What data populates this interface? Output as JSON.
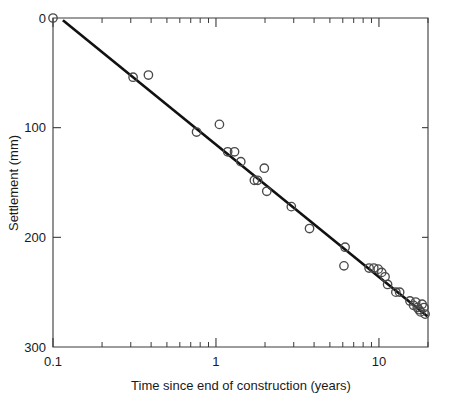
{
  "chart_data": {
    "type": "scatter",
    "title": "",
    "subtitle": "",
    "xlabel": "Time since end of construction (years)",
    "ylabel": "Settlement (mm)",
    "xscale": "log",
    "yscale": "linear",
    "xlim": [
      0.1,
      20.0
    ],
    "ylim": [
      0,
      300
    ],
    "y_inverted": true,
    "grid": false,
    "legend": null,
    "x_tick_labels": [
      "0.1",
      "1",
      "10"
    ],
    "x_tick_values": [
      0.1,
      1,
      10
    ],
    "x_minor_ticks": [
      0.2,
      0.3,
      0.4,
      0.5,
      0.6,
      0.7,
      0.8,
      0.9,
      2,
      3,
      4,
      5,
      6,
      7,
      8,
      9,
      20
    ],
    "y_tick_labels": [
      "0",
      "100",
      "200",
      "300"
    ],
    "y_tick_values": [
      0,
      100,
      200,
      300
    ],
    "marker_style": "open-circle",
    "marker_radius_px": 4.2,
    "series": [
      {
        "name": "Observed settlement",
        "points": [
          [
            0.1,
            0
          ],
          [
            0.31,
            54
          ],
          [
            0.385,
            52
          ],
          [
            0.76,
            104
          ],
          [
            1.05,
            97
          ],
          [
            1.18,
            122
          ],
          [
            1.3,
            122
          ],
          [
            1.42,
            131
          ],
          [
            1.72,
            148
          ],
          [
            1.8,
            148
          ],
          [
            1.98,
            137
          ],
          [
            2.05,
            158
          ],
          [
            2.9,
            172
          ],
          [
            3.75,
            192
          ],
          [
            6.1,
            226
          ],
          [
            6.2,
            209
          ],
          [
            8.7,
            228
          ],
          [
            9.3,
            228
          ],
          [
            9.9,
            229
          ],
          [
            10.4,
            232
          ],
          [
            10.9,
            236
          ],
          [
            11.3,
            243
          ],
          [
            12.7,
            250
          ],
          [
            13.4,
            250
          ],
          [
            15.5,
            258
          ],
          [
            16.3,
            262
          ],
          [
            16.8,
            259
          ],
          [
            17.2,
            264
          ],
          [
            17.6,
            266
          ],
          [
            18.0,
            268
          ],
          [
            18.4,
            261
          ],
          [
            18.9,
            264
          ],
          [
            19.2,
            270
          ]
        ]
      }
    ],
    "trend_line": {
      "name": "Fitted log-linear trend",
      "points": [
        [
          0.115,
          2
        ],
        [
          19.8,
          272
        ]
      ]
    }
  }
}
